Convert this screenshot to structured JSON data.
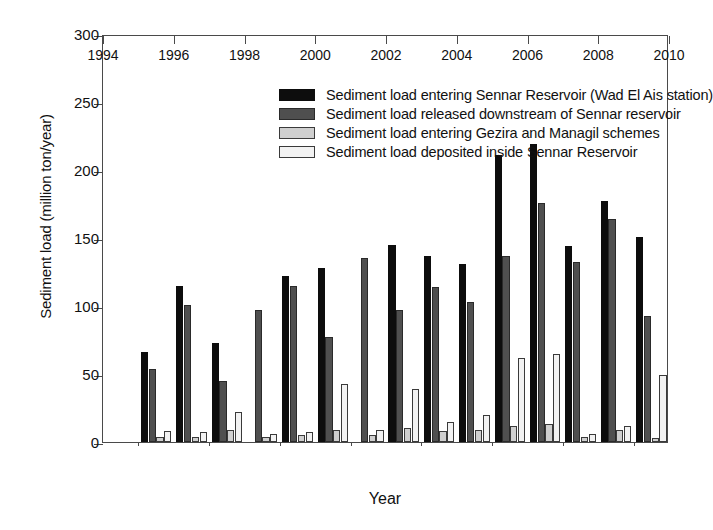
{
  "chart_data": {
    "type": "bar",
    "title": "",
    "xlabel": "Year",
    "ylabel": "Sediment load (million ton/year)",
    "ylim": [
      0,
      300
    ],
    "yticks": [
      0,
      50,
      100,
      150,
      200,
      250,
      300
    ],
    "xlim": [
      1994,
      2010
    ],
    "xticks": [
      1994,
      1996,
      1998,
      2000,
      2002,
      2004,
      2006,
      2008,
      2010
    ],
    "xminor_ticks": [
      1995,
      1997,
      1999,
      2001,
      2003,
      2005,
      2007,
      2009
    ],
    "grid": false,
    "legend_position": "top-center-inside",
    "categories": [
      1995,
      1996,
      1997,
      1998,
      1999,
      2000,
      2001,
      2002,
      2003,
      2004,
      2005,
      2006,
      2007,
      2008,
      2009
    ],
    "series": [
      {
        "name": "Sediment load entering Sennar Reservoir (Wad El Ais station)",
        "color": "#0d0d0d",
        "values": [
          66,
          115,
          73,
          null,
          122,
          128,
          null,
          145,
          137,
          131,
          211,
          219,
          144,
          177,
          151
        ]
      },
      {
        "name": "Sediment load released downstream of Sennar reservoir",
        "color": "#4f4f4f",
        "values": [
          54,
          101,
          45,
          97,
          115,
          77,
          135,
          97,
          114,
          103,
          137,
          176,
          132,
          164,
          93
        ]
      },
      {
        "name": "Sediment load entering Gezira and Managil schemes",
        "color": "#cfcfcf",
        "values": [
          4,
          4,
          9,
          4,
          5,
          9,
          5,
          10,
          8,
          9,
          12,
          13,
          4,
          9,
          3
        ]
      },
      {
        "name": "Sediment load deposited inside Sennar Reservoir",
        "color": "#f2f2f2",
        "values": [
          8,
          7,
          22,
          6,
          7,
          43,
          9,
          39,
          15,
          20,
          62,
          65,
          6,
          12,
          49
        ]
      }
    ]
  },
  "axes": {
    "ylabel": "Sediment load (million ton/year)",
    "xlabel": "Year",
    "ytick_labels": [
      "0",
      "50",
      "100",
      "150",
      "200",
      "250",
      "300"
    ],
    "xtick_labels": [
      "1994",
      "1996",
      "1998",
      "2000",
      "2002",
      "2004",
      "2006",
      "2008",
      "2010"
    ]
  },
  "legend": {
    "items": [
      {
        "label": "Sediment load entering Sennar Reservoir (Wad El Ais station)",
        "color": "#0d0d0d"
      },
      {
        "label": "Sediment load released downstream of Sennar reservoir",
        "color": "#4f4f4f"
      },
      {
        "label": "Sediment load entering Gezira and Managil schemes",
        "color": "#cfcfcf"
      },
      {
        "label": "Sediment load deposited inside Sennar Reservoir",
        "color": "#f2f2f2"
      }
    ]
  }
}
